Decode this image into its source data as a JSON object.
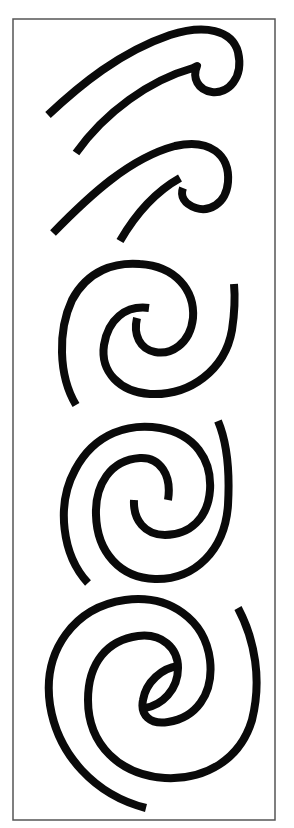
{
  "figure": {
    "title": "Koru motif progression",
    "colors": {
      "ink": "#0a0a0a",
      "frame": "#555555",
      "background": "#ffffff"
    },
    "frame": {
      "x": 13,
      "y": 19,
      "width": 262,
      "height": 801
    },
    "motifs": [
      {
        "id": 1,
        "type": "hook",
        "label": "Hooked curve 1"
      },
      {
        "id": 2,
        "type": "hook",
        "label": "Hooked curve 2"
      },
      {
        "id": 3,
        "type": "double-spiral",
        "label": "Double spiral 1"
      },
      {
        "id": 4,
        "type": "double-spiral",
        "label": "Double spiral 2"
      },
      {
        "id": 5,
        "type": "double-spiral",
        "label": "Double spiral 3"
      }
    ]
  }
}
